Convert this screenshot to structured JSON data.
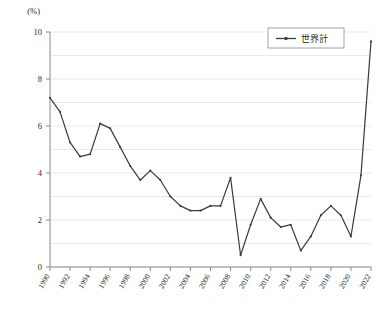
{
  "chart_data": {
    "type": "line",
    "title": "",
    "xlabel": "",
    "ylabel": "",
    "unit_label": "(%)",
    "grid": true,
    "legend_position": "top-right",
    "ylim": [
      0,
      10
    ],
    "yticks": [
      0,
      2,
      4,
      6,
      8,
      10
    ],
    "ytick_labels": [
      "0",
      "2",
      "4",
      "6",
      "8",
      "10"
    ],
    "xlim": [
      1990,
      2022
    ],
    "xticks": [
      1990,
      1992,
      1994,
      1996,
      1998,
      2000,
      2002,
      2004,
      2006,
      2008,
      2010,
      2012,
      2014,
      2016,
      2018,
      2020,
      2022
    ],
    "xtick_labels": [
      "1990",
      "1992",
      "1994",
      "1996",
      "1998",
      "2000",
      "2002",
      "2004",
      "2006",
      "2008",
      "2010",
      "2012",
      "2014",
      "2016",
      "2018",
      "2020",
      "2022"
    ],
    "x": [
      1990,
      1991,
      1992,
      1993,
      1994,
      1995,
      1996,
      1997,
      1998,
      1999,
      2000,
      2001,
      2002,
      2003,
      2004,
      2005,
      2006,
      2007,
      2008,
      2009,
      2010,
      2011,
      2012,
      2013,
      2014,
      2015,
      2016,
      2017,
      2018,
      2019,
      2020,
      2021,
      2022
    ],
    "series": [
      {
        "name": "世界計",
        "color": "#3b3b3b",
        "values": [
          7.2,
          6.6,
          5.3,
          4.7,
          4.8,
          6.1,
          5.9,
          5.1,
          4.3,
          3.7,
          4.1,
          3.7,
          3.0,
          2.6,
          2.4,
          2.4,
          2.6,
          2.6,
          3.8,
          0.5,
          1.8,
          2.9,
          2.1,
          1.7,
          1.8,
          0.7,
          1.3,
          2.2,
          2.6,
          2.2,
          1.3,
          3.9,
          9.6
        ]
      }
    ],
    "legend": [
      {
        "label": "世界計",
        "color": "#3b3b3b"
      }
    ]
  }
}
